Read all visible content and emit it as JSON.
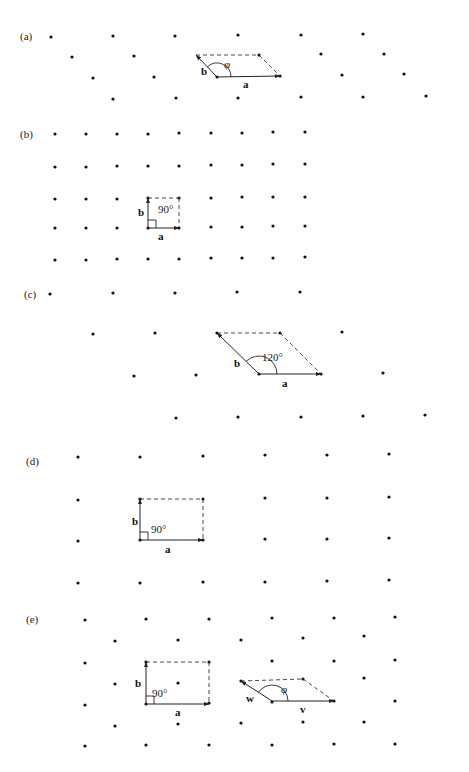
{
  "figure": {
    "width": 469,
    "height": 772,
    "dot_radius": 1.6,
    "panels": [
      {
        "id": "a",
        "label": "(a)",
        "label_pos": [
          20,
          40
        ],
        "points": [
          [
            51,
            37
          ],
          [
            113,
            36
          ],
          [
            175,
            36
          ],
          [
            238,
            35
          ],
          [
            301,
            35
          ],
          [
            363,
            34
          ],
          [
            72,
            57
          ],
          [
            134,
            56
          ],
          [
            259,
            55
          ],
          [
            321,
            54
          ],
          [
            384,
            54
          ],
          [
            93,
            78
          ],
          [
            154,
            77
          ],
          [
            217,
            77
          ],
          [
            280,
            76
          ],
          [
            342,
            75
          ],
          [
            404,
            74
          ],
          [
            113,
            99
          ],
          [
            176,
            98
          ],
          [
            238,
            98
          ],
          [
            301,
            97
          ],
          [
            363,
            97
          ],
          [
            426,
            96
          ]
        ],
        "vectors": [
          {
            "name": "a",
            "from": [
              217,
              77
            ],
            "to": [
              280,
              76
            ],
            "label": "a",
            "label_pos": [
              243,
              88
            ]
          },
          {
            "name": "b",
            "from": [
              217,
              77
            ],
            "to": [
              196,
              55
            ],
            "label": "b",
            "label_pos": [
              201,
              75
            ]
          }
        ],
        "dashed": [
          [
            [
              196,
              55
            ],
            [
              259,
              55
            ]
          ],
          [
            [
              259,
              55
            ],
            [
              280,
              76
            ]
          ]
        ],
        "arc": {
          "cx": 217,
          "cy": 77,
          "r": 14,
          "start": 0,
          "end": 133
        },
        "angle_label": "φ",
        "angle_label_pos": [
          224,
          68
        ],
        "angle_italic": true
      },
      {
        "id": "b",
        "label": "(b)",
        "label_pos": [
          20,
          138
        ],
        "points": [
          [
            55,
            134
          ],
          [
            86,
            134
          ],
          [
            117,
            134
          ],
          [
            148,
            134
          ],
          [
            179,
            133
          ],
          [
            211,
            133
          ],
          [
            242,
            133
          ],
          [
            273,
            132
          ],
          [
            305,
            132
          ],
          [
            55,
            167
          ],
          [
            86,
            167
          ],
          [
            117,
            166
          ],
          [
            148,
            166
          ],
          [
            179,
            166
          ],
          [
            211,
            165
          ],
          [
            242,
            165
          ],
          [
            273,
            164
          ],
          [
            305,
            164
          ],
          [
            55,
            199
          ],
          [
            86,
            199
          ],
          [
            117,
            199
          ],
          [
            148,
            198
          ],
          [
            179,
            198
          ],
          [
            211,
            198
          ],
          [
            242,
            197
          ],
          [
            273,
            197
          ],
          [
            305,
            197
          ],
          [
            55,
            228
          ],
          [
            86,
            228
          ],
          [
            117,
            228
          ],
          [
            148,
            228
          ],
          [
            179,
            228
          ],
          [
            211,
            227
          ],
          [
            242,
            227
          ],
          [
            273,
            226
          ],
          [
            305,
            226
          ],
          [
            55,
            260
          ],
          [
            86,
            260
          ],
          [
            117,
            259
          ],
          [
            148,
            259
          ],
          [
            179,
            259
          ],
          [
            211,
            258
          ],
          [
            242,
            258
          ],
          [
            273,
            258
          ],
          [
            305,
            257
          ]
        ],
        "vectors": [
          {
            "name": "a",
            "from": [
              148,
              228
            ],
            "to": [
              179,
              228
            ],
            "label": "a",
            "label_pos": [
              158,
              240
            ]
          },
          {
            "name": "b",
            "from": [
              148,
              228
            ],
            "to": [
              148,
              198
            ],
            "label": "b",
            "label_pos": [
              138,
              216
            ]
          }
        ],
        "dashed": [
          [
            [
              148,
              198
            ],
            [
              179,
              198
            ]
          ],
          [
            [
              179,
              198
            ],
            [
              179,
              228
            ]
          ]
        ],
        "right_angle": {
          "x": 148,
          "y": 228,
          "size": 8
        },
        "angle_label": "90°",
        "angle_label_pos": [
          158,
          213
        ],
        "angle_italic": false
      },
      {
        "id": "c",
        "label": "(c)",
        "label_pos": [
          24,
          298
        ],
        "points": [
          [
            50,
            294
          ],
          [
            113,
            293
          ],
          [
            175,
            293
          ],
          [
            237,
            292
          ],
          [
            300,
            292
          ],
          [
            93,
            334
          ],
          [
            155,
            333
          ],
          [
            217,
            333
          ],
          [
            280,
            333
          ],
          [
            342,
            332
          ],
          [
            134,
            376
          ],
          [
            196,
            375
          ],
          [
            259,
            374
          ],
          [
            321,
            374
          ],
          [
            383,
            373
          ],
          [
            176,
            418
          ],
          [
            238,
            417
          ],
          [
            301,
            417
          ],
          [
            363,
            416
          ],
          [
            425,
            415
          ]
        ],
        "vectors": [
          {
            "name": "a",
            "from": [
              259,
              374
            ],
            "to": [
              321,
              374
            ],
            "label": "a",
            "label_pos": [
              282,
              387
            ]
          },
          {
            "name": "b",
            "from": [
              259,
              374
            ],
            "to": [
              217,
              333
            ],
            "label": "b",
            "label_pos": [
              234,
              367
            ]
          }
        ],
        "dashed": [
          [
            [
              217,
              333
            ],
            [
              280,
              333
            ]
          ],
          [
            [
              280,
              333
            ],
            [
              321,
              374
            ]
          ]
        ],
        "arc": {
          "cx": 259,
          "cy": 374,
          "r": 18,
          "start": 0,
          "end": 135
        },
        "angle_label": "120°",
        "angle_label_pos": [
          262,
          361
        ],
        "angle_italic": false
      },
      {
        "id": "d",
        "label": "(d)",
        "label_pos": [
          26,
          465
        ],
        "points": [
          [
            78,
            457
          ],
          [
            140,
            457
          ],
          [
            203,
            456
          ],
          [
            265,
            455
          ],
          [
            327,
            455
          ],
          [
            389,
            454
          ],
          [
            78,
            500
          ],
          [
            140,
            499
          ],
          [
            203,
            499
          ],
          [
            265,
            498
          ],
          [
            327,
            498
          ],
          [
            389,
            497
          ],
          [
            78,
            541
          ],
          [
            140,
            540
          ],
          [
            203,
            540
          ],
          [
            265,
            539
          ],
          [
            327,
            539
          ],
          [
            389,
            538
          ],
          [
            78,
            583
          ],
          [
            140,
            583
          ],
          [
            203,
            582
          ],
          [
            265,
            582
          ],
          [
            327,
            581
          ],
          [
            389,
            580
          ]
        ],
        "vectors": [
          {
            "name": "a",
            "from": [
              140,
              540
            ],
            "to": [
              203,
              540
            ],
            "label": "a",
            "label_pos": [
              165,
              553
            ]
          },
          {
            "name": "b",
            "from": [
              140,
              540
            ],
            "to": [
              140,
              499
            ],
            "label": "b",
            "label_pos": [
              132,
              525
            ]
          }
        ],
        "dashed": [
          [
            [
              140,
              499
            ],
            [
              203,
              499
            ]
          ],
          [
            [
              203,
              499
            ],
            [
              203,
              540
            ]
          ]
        ],
        "right_angle": {
          "x": 140,
          "y": 540,
          "size": 8
        },
        "angle_label": "90°",
        "angle_label_pos": [
          151,
          533
        ],
        "angle_italic": false
      },
      {
        "id": "e",
        "label": "(e)",
        "label_pos": [
          26,
          623
        ],
        "points": [
          [
            85,
            620
          ],
          [
            146,
            619
          ],
          [
            209,
            619
          ],
          [
            272,
            618
          ],
          [
            334,
            618
          ],
          [
            395,
            617
          ],
          [
            115,
            641
          ],
          [
            178,
            640
          ],
          [
            241,
            640
          ],
          [
            303,
            638
          ],
          [
            364,
            636
          ],
          [
            85,
            663
          ],
          [
            146,
            662
          ],
          [
            209,
            662
          ],
          [
            272,
            661
          ],
          [
            334,
            661
          ],
          [
            395,
            660
          ],
          [
            115,
            684
          ],
          [
            178,
            683
          ],
          [
            241,
            681
          ],
          [
            303,
            679
          ],
          [
            364,
            678
          ],
          [
            85,
            705
          ],
          [
            146,
            704
          ],
          [
            209,
            703
          ],
          [
            272,
            702
          ],
          [
            334,
            701
          ],
          [
            395,
            701
          ],
          [
            115,
            726
          ],
          [
            178,
            724
          ],
          [
            241,
            723
          ],
          [
            303,
            722
          ],
          [
            364,
            722
          ],
          [
            85,
            746
          ],
          [
            146,
            745
          ],
          [
            209,
            745
          ],
          [
            272,
            745
          ],
          [
            334,
            744
          ],
          [
            395,
            744
          ]
        ],
        "lattice_a": {
          "vectors": [
            {
              "name": "a",
              "from": [
                146,
                704
              ],
              "to": [
                209,
                704
              ],
              "label": "a",
              "label_pos": [
                175,
                716
              ]
            },
            {
              "name": "b",
              "from": [
                146,
                704
              ],
              "to": [
                146,
                662
              ],
              "label": "b",
              "label_pos": [
                135,
                687
              ]
            }
          ],
          "dashed": [
            [
              [
                146,
                662
              ],
              [
                209,
                662
              ]
            ],
            [
              [
                209,
                662
              ],
              [
                209,
                704
              ]
            ]
          ],
          "right_angle": {
            "x": 146,
            "y": 704,
            "size": 8
          },
          "angle_label": "90°",
          "angle_label_pos": [
            152,
            697
          ]
        },
        "lattice_b": {
          "vectors": [
            {
              "name": "v",
              "from": [
                272,
                701
              ],
              "to": [
                334,
                701
              ],
              "label": "v",
              "label_pos": [
                300,
                713
              ]
            },
            {
              "name": "w",
              "from": [
                272,
                701
              ],
              "to": [
                241,
                681
              ],
              "label": "w",
              "label_pos": [
                246,
                702
              ]
            }
          ],
          "dashed": [
            [
              [
                241,
                681
              ],
              [
                303,
                679
              ]
            ],
            [
              [
                303,
                679
              ],
              [
                334,
                701
              ]
            ]
          ],
          "arc": {
            "cx": 272,
            "cy": 701,
            "r": 16,
            "start": 0,
            "end": 148
          },
          "angle_label": "φ",
          "angle_label_pos": [
            281,
            693
          ],
          "angle_italic": true
        }
      }
    ],
    "caption_fragment": "…                              …                        …"
  }
}
